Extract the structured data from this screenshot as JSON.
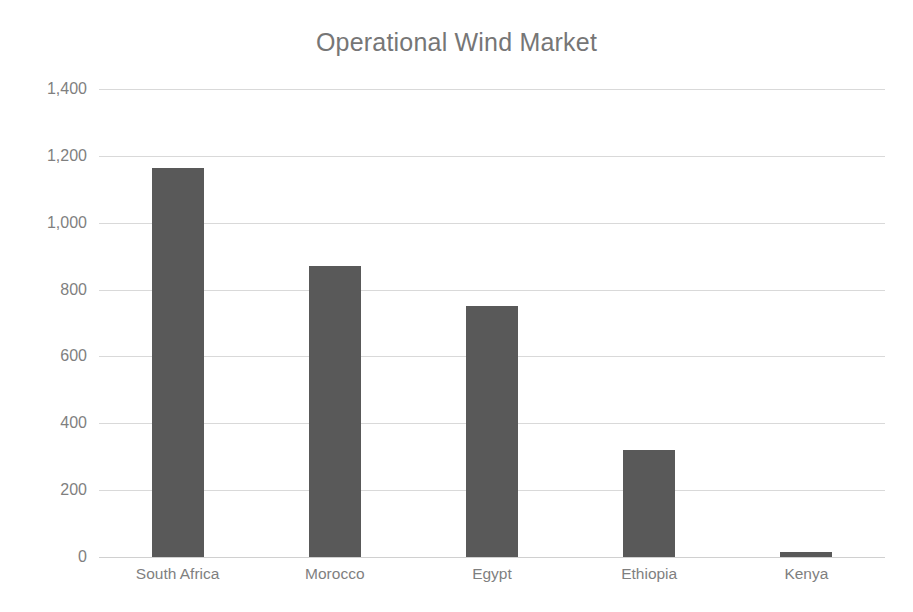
{
  "chart_data": {
    "type": "bar",
    "title": "Operational Wind Market",
    "xlabel": "",
    "ylabel": "",
    "categories": [
      "South Africa",
      "Morocco",
      "Egypt",
      "Ethiopia",
      "Kenya"
    ],
    "values": [
      1165,
      870,
      750,
      320,
      15
    ],
    "ylim": [
      0,
      1400
    ],
    "ytick_labels": [
      "1,400",
      "1,200",
      "1,000",
      "800",
      "600",
      "400",
      "200",
      "0"
    ],
    "ytick_values": [
      1400,
      1200,
      1000,
      800,
      600,
      400,
      200,
      0
    ],
    "grid": true,
    "legend": false,
    "legend_position": "none",
    "bar_color": "#595959",
    "gridline_color": "#d9d9d9",
    "title_color": "#767676",
    "tick_label_color": "#7f7f7f",
    "background_color": "#ffffff"
  }
}
